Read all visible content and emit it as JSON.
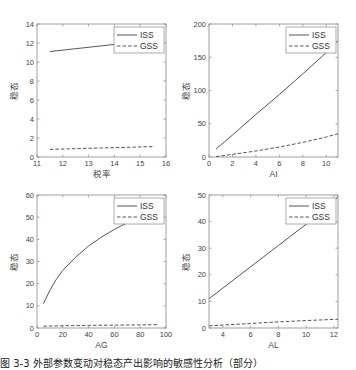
{
  "chart_data": [
    {
      "type": "line",
      "title": "",
      "xlabel": "税率",
      "ylabel": "稳态",
      "xlim": [
        11,
        16
      ],
      "ylim": [
        0,
        14
      ],
      "xticks": [
        11,
        12,
        13,
        14,
        15,
        16
      ],
      "yticks": [
        0,
        2,
        4,
        6,
        8,
        10,
        12,
        14
      ],
      "legend": [
        "ISS",
        "GSS"
      ],
      "legend_position": "upper right",
      "grid": false,
      "series": [
        {
          "name": "ISS",
          "style": "solid",
          "x": [
            11.5,
            12.5,
            13.5,
            14.5,
            15.5
          ],
          "y": [
            11.1,
            11.4,
            11.7,
            12.0,
            12.3
          ]
        },
        {
          "name": "GSS",
          "style": "dashed",
          "x": [
            11.5,
            12.5,
            13.5,
            14.5,
            15.5
          ],
          "y": [
            0.8,
            0.88,
            0.95,
            1.02,
            1.1
          ]
        }
      ]
    },
    {
      "type": "line",
      "title": "",
      "xlabel": "AI",
      "ylabel": "稳态",
      "xlim": [
        0,
        11
      ],
      "ylim": [
        0,
        200
      ],
      "xticks": [
        0,
        2,
        4,
        6,
        8,
        10
      ],
      "yticks": [
        0,
        50,
        100,
        150,
        200
      ],
      "legend": [
        "ISS",
        "GSS"
      ],
      "legend_position": "upper right",
      "grid": false,
      "series": [
        {
          "name": "ISS",
          "style": "solid",
          "x": [
            0.6,
            2,
            4,
            6,
            8,
            10,
            11
          ],
          "y": [
            12,
            33,
            64,
            94,
            125,
            157,
            175
          ]
        },
        {
          "name": "GSS",
          "style": "dashed",
          "x": [
            0.6,
            2,
            4,
            6,
            8,
            10,
            11
          ],
          "y": [
            0.5,
            4,
            9,
            15,
            22,
            30,
            35
          ]
        }
      ]
    },
    {
      "type": "line",
      "title": "",
      "xlabel": "AG",
      "ylabel": "稳态",
      "xlim": [
        0,
        100
      ],
      "ylim": [
        0,
        60
      ],
      "xticks": [
        0,
        20,
        40,
        60,
        80,
        100
      ],
      "yticks": [
        0,
        10,
        20,
        30,
        40,
        50,
        60
      ],
      "legend": [
        "ISS",
        "GSS"
      ],
      "legend_position": "upper right",
      "grid": false,
      "series": [
        {
          "name": "ISS",
          "style": "solid",
          "x": [
            5,
            10,
            15,
            20,
            30,
            40,
            50,
            60,
            70,
            80,
            93
          ],
          "y": [
            11,
            17,
            22,
            26,
            32,
            37,
            41,
            44.5,
            47.5,
            50.5,
            54
          ]
        },
        {
          "name": "GSS",
          "style": "dashed",
          "x": [
            5,
            20,
            40,
            60,
            80,
            93
          ],
          "y": [
            0.8,
            1.0,
            1.2,
            1.3,
            1.4,
            1.5
          ]
        }
      ]
    },
    {
      "type": "line",
      "title": "",
      "xlabel": "AL",
      "ylabel": "稳态",
      "xlim": [
        3,
        12.3
      ],
      "ylim": [
        0,
        50
      ],
      "xticks": [
        4,
        6,
        8,
        10,
        12
      ],
      "yticks": [
        0,
        10,
        20,
        30,
        40,
        50
      ],
      "legend": [
        "ISS",
        "GSS"
      ],
      "legend_position": "upper right",
      "grid": false,
      "series": [
        {
          "name": "ISS",
          "style": "solid",
          "x": [
            3,
            4,
            6,
            8,
            10,
            12,
            12.3
          ],
          "y": [
            11,
            15,
            23,
            31,
            39,
            47.5,
            49.5
          ]
        },
        {
          "name": "GSS",
          "style": "dashed",
          "x": [
            3,
            4,
            6,
            8,
            10,
            12.3
          ],
          "y": [
            0.8,
            1.1,
            1.7,
            2.3,
            2.8,
            3.3
          ]
        }
      ]
    }
  ],
  "caption": "图 3-3  外部参数变动对稳态产出影响的敏感性分析（部分）",
  "colors": {
    "line": "#555555",
    "axis": "#888888",
    "text": "#444444",
    "background": "#ffffff"
  }
}
